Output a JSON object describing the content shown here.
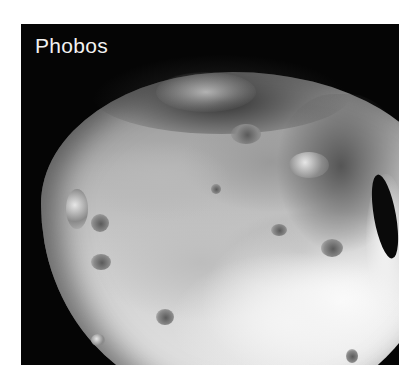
{
  "image": {
    "subject": "Phobos moon surface photograph",
    "label": "Phobos",
    "label_color": "#f2f2f2",
    "background_color": "#050505",
    "page_background": "#ffffff"
  }
}
